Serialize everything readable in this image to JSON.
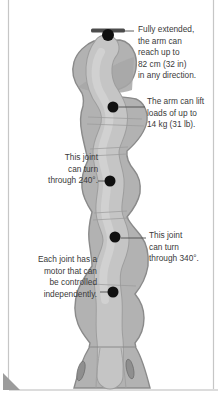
{
  "diagram": {
    "labels": {
      "reach": {
        "lines": [
          "Fully extended,",
          "the arm can",
          "reach up to",
          "82 cm (32 in)",
          "in any direction."
        ]
      },
      "lift": {
        "lines": [
          "The arm can lift",
          "loads of up to",
          "14 kg (31 lb)."
        ]
      },
      "joint_240": {
        "lines": [
          "This joint",
          "can turn",
          "through 240°."
        ]
      },
      "joint_340": {
        "lines": [
          "This joint",
          "can turn",
          "through 340°."
        ]
      },
      "motor": {
        "lines": [
          "Each joint has a",
          "motor that can",
          "be controlled",
          "independently."
        ]
      }
    },
    "colors": {
      "arm_body": "#b2b2b2",
      "arm_outline": "#8a8a8a",
      "arm_inner": "#c5c5c5",
      "arm_highlight": "#d2d2d2",
      "joint_dot": "#101010",
      "leader_line": "#4d4d4d",
      "text": "#3a3a3a",
      "frame_line": "#c6c6c6",
      "corner_fold": "#9c9c9c"
    }
  }
}
